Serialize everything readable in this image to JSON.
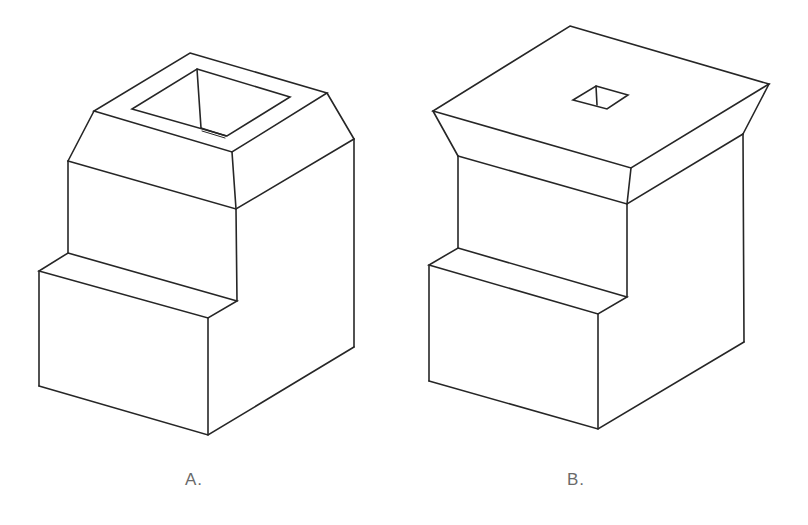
{
  "figures": [
    {
      "id": "A",
      "label": "A.",
      "description": "Isometric block with lower front step, chamfered top and a large tapered square recess in the top face",
      "top_face": [
        [
          190,
          53
        ],
        [
          327,
          93
        ],
        [
          232,
          152
        ],
        [
          94,
          111
        ]
      ],
      "recess": {
        "outline": [
          [
            197,
            69
          ],
          [
            290,
            97
          ],
          [
            227,
            136
          ],
          [
            132,
            109
          ]
        ],
        "inner_edge": [
          [
            197,
            69
          ],
          [
            201,
            128
          ]
        ],
        "bottom_edge": [
          [
            201,
            128
          ],
          [
            225,
            136
          ]
        ]
      },
      "chamfer_lower": {
        "left": [
          68,
          161
        ],
        "front": [
          236,
          209
        ],
        "right": [
          354,
          139
        ]
      },
      "step": {
        "back_left": [
          68,
          253
        ],
        "front_left_top": [
          39,
          271
        ],
        "inner_corner": [
          237,
          301
        ],
        "front_corner": [
          208,
          318
        ]
      },
      "base": {
        "bottom_left": [
          39,
          386
        ],
        "bottom_front": [
          208,
          435
        ],
        "bottom_right": [
          354,
          347
        ]
      }
    },
    {
      "id": "B",
      "label": "B.",
      "description": "Isometric block with lower front step, flared (inverted-chamfer) cap and a small square hole in the top face",
      "top_face": [
        [
          570,
          26
        ],
        [
          769,
          84
        ],
        [
          631,
          168
        ],
        [
          433,
          111
        ]
      ],
      "hole": {
        "outline": [
          [
            596,
            86
          ],
          [
            628,
            95
          ],
          [
            607,
            109
          ],
          [
            573,
            100
          ]
        ],
        "inner_edge": [
          [
            596,
            86
          ],
          [
            597,
            105
          ]
        ]
      },
      "chamfer_lower": {
        "left": [
          458,
          156
        ],
        "front": [
          627,
          204
        ],
        "right": [
          743,
          134
        ]
      },
      "step": {
        "back_left": [
          458,
          248
        ],
        "front_left_top": [
          429,
          265
        ],
        "inner_corner": [
          627,
          297
        ],
        "front_corner": [
          598,
          314
        ]
      },
      "base": {
        "bottom_left": [
          429,
          381
        ],
        "bottom_front": [
          598,
          429
        ],
        "bottom_right": [
          744,
          342
        ]
      }
    }
  ],
  "labels": {
    "a": "A.",
    "b": "B."
  },
  "colors": {
    "line": "#262626",
    "label": "#6a6a6a",
    "background": "#ffffff"
  }
}
